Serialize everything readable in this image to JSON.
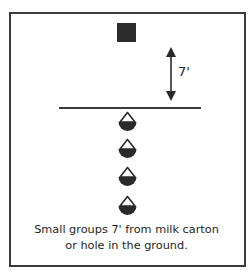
{
  "diagram": {
    "title_fragment": "",
    "target": {
      "label": "milk carton",
      "shape": "square",
      "color": "#2c2c2c"
    },
    "distance_marker": {
      "label": "7'",
      "icon": "double-arrow-vertical"
    },
    "start_line": {
      "color": "#3a3a3a"
    },
    "players": [
      {
        "icon": "player-icon",
        "top": 111
      },
      {
        "icon": "player-icon",
        "top": 138
      },
      {
        "icon": "player-icon",
        "top": 166
      },
      {
        "icon": "player-icon",
        "top": 195
      }
    ],
    "caption": {
      "line1": "Small groups 7' from milk carton",
      "line2": "or hole in the ground."
    }
  }
}
